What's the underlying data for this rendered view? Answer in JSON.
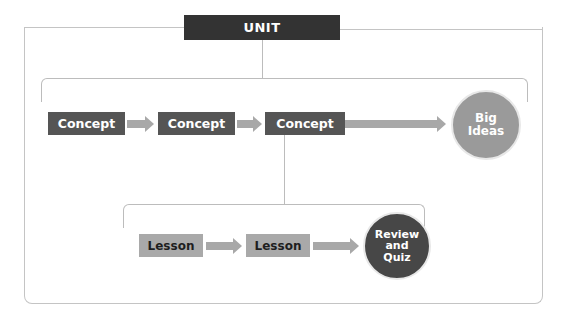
{
  "diagram": {
    "unit": {
      "label": "UNIT"
    },
    "concepts": [
      {
        "label": "Concept"
      },
      {
        "label": "Concept"
      },
      {
        "label": "Concept"
      }
    ],
    "big_ideas": {
      "label_line1": "Big",
      "label_line2": "Ideas"
    },
    "lessons": [
      {
        "label": "Lesson"
      },
      {
        "label": "Lesson"
      }
    ],
    "review": {
      "label_line1": "Review",
      "label_line2": "and",
      "label_line3": "Quiz"
    },
    "colors": {
      "unit_bg": "#333333",
      "concept_bg": "#555555",
      "lesson_bg": "#a9a9a9",
      "big_ideas_bg": "#9a9a9a",
      "review_bg": "#474747",
      "arrow": "#a8a8a8",
      "line": "#bcbcbc"
    }
  }
}
